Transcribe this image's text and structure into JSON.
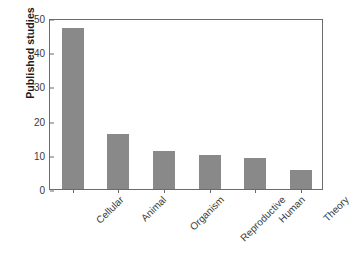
{
  "chart_data": {
    "type": "bar",
    "title": "",
    "xlabel": "",
    "ylabel": "Published studies",
    "categories": [
      "Cellular",
      "Animal",
      "Organism",
      "Reproductive",
      "Human",
      "Theory"
    ],
    "values": [
      47,
      16,
      11,
      10,
      9,
      5.5
    ],
    "ylim": [
      0,
      50
    ],
    "yticks": [
      0,
      10,
      20,
      30,
      40,
      50
    ],
    "ytick_labels": [
      "0",
      "10",
      "20",
      "30",
      "40",
      "50"
    ],
    "grid": false,
    "legend": false,
    "bar_color": "#898989",
    "frame_color": "#6b6b6b",
    "background": "#ffffff",
    "xtick_label_rotation": -45
  }
}
